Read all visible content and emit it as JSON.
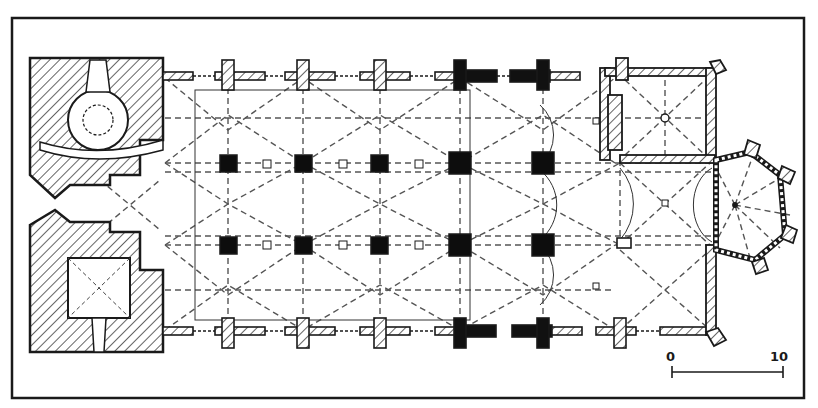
{
  "figure": {
    "type": "architectural-floor-plan",
    "colors": {
      "ink": "#1a1a1a",
      "paper": "#ffffff",
      "hatch": "#222222",
      "dashed": "#555555"
    }
  },
  "scale_bar": {
    "start_label": "0",
    "end_label": "10"
  },
  "elements": {
    "west_block": "hatched west tower block with spiral stair and porch",
    "nave": "three-aisled hall nave with vaulting lines",
    "piers": {
      "rows": 2,
      "per_row": 5
    },
    "choir": "rectangular choir with sacristy on north side",
    "apse": "polygonal apse with buttresses"
  }
}
